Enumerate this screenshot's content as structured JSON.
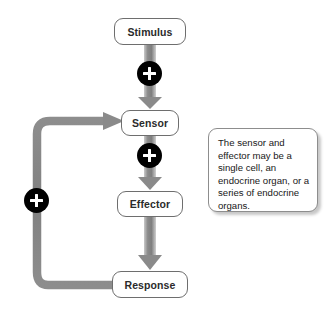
{
  "diagram": {
    "type": "flowchart",
    "nodes": [
      {
        "id": "stimulus",
        "label": "Stimulus"
      },
      {
        "id": "sensor",
        "label": "Sensor"
      },
      {
        "id": "effector",
        "label": "Effector"
      },
      {
        "id": "response",
        "label": "Response"
      }
    ],
    "signs": [
      {
        "id": "plus-stimulus-sensor",
        "symbol": "+",
        "on_edge": "stimulus-to-sensor"
      },
      {
        "id": "plus-sensor-effector",
        "symbol": "+",
        "on_edge": "sensor-to-effector"
      },
      {
        "id": "plus-feedback",
        "symbol": "+",
        "on_edge": "response-to-sensor-feedback"
      }
    ],
    "edges": [
      {
        "from": "stimulus",
        "to": "sensor",
        "style": "arrow-down"
      },
      {
        "from": "sensor",
        "to": "effector",
        "style": "arrow-down"
      },
      {
        "from": "effector",
        "to": "response",
        "style": "arrow-down"
      },
      {
        "from": "response",
        "to": "sensor",
        "style": "feedback-loop-left"
      }
    ],
    "note": {
      "text": "The sensor and effector may be a single cell, an endocrine organ, or a series of endocrine organs."
    },
    "colors": {
      "arrow": "#8a8a8a",
      "feedback_arrow": "#8a8a8a",
      "node_border": "#6e6e6e",
      "node_fill": "#ffffff",
      "sign_fill": "#000000",
      "sign_glyph": "#ffffff",
      "text": "#2b2b2b",
      "note_border": "#8d8d8d",
      "background": "#ffffff"
    }
  }
}
